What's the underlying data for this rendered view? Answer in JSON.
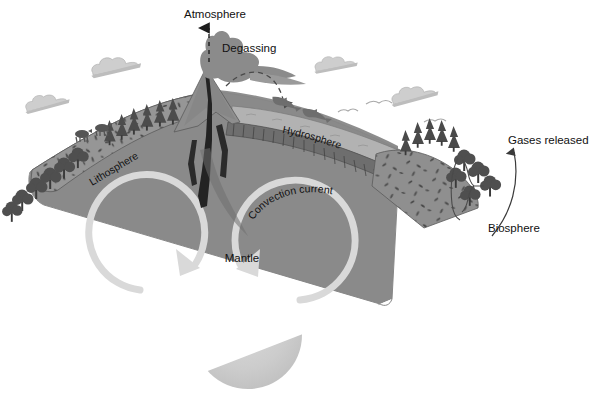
{
  "figure": {
    "background_color": "#ffffff"
  },
  "labels": {
    "atmosphere": "Atmosphere",
    "degassing": "Degassing",
    "hydrosphere": "Hydrosphere",
    "lithosphere": "Lithosphere",
    "biosphere": "Biosphere",
    "gases_released": "Gases released",
    "convection_current": "Convection current",
    "mantle": "Mantle",
    "core": "Core"
  },
  "colors": {
    "mantle": "#8c8c8c",
    "mantle_dark": "#7e7e7e",
    "lithosphere": "#949494",
    "lithosphere_speck": "#4a4a4a",
    "crust_band": "#6f6f6f",
    "ocean": "#a8a8a8",
    "core": "#cfcfcf",
    "arrow": "#d8d8d8",
    "vegetation": "#5d5d5d",
    "vegetation_dark": "#3c3c3c",
    "cloud": "#d0d0d0",
    "smoke": "#8f8f8f",
    "magma": "#2c2c2c",
    "text": "#111111",
    "leader": "#444444"
  },
  "annotations": {
    "atmosphere_arrow": "dashed-vertical-arrow-up",
    "degassing_marker": "dashed-line",
    "gases_released_arrow": "curved-arrow-up",
    "biosphere_bracket": "curly-brace",
    "convection_left": "clockwise-circular-arrow",
    "convection_right": "counterclockwise-circular-arrow",
    "ejecta_path": "dashed-ballistic-arc"
  },
  "scene_elements": {
    "clouds": 4,
    "birds": 3,
    "dolphins": 2,
    "left_slope_trees": 14,
    "right_slope_trees": 12,
    "grazing_animals": 2,
    "volcano": "erupting-volcano-with-ash-plume"
  }
}
